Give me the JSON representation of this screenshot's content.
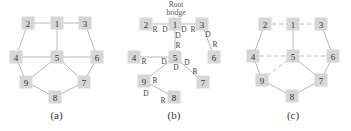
{
  "figure": {
    "panels": [
      {
        "id": "a",
        "caption": "(a)",
        "description": "Full bridged network topology",
        "nodes": [
          {
            "id": "1",
            "x": 57,
            "y": 23
          },
          {
            "id": "2",
            "x": 28,
            "y": 23
          },
          {
            "id": "3",
            "x": 85,
            "y": 23
          },
          {
            "id": "4",
            "x": 16,
            "y": 57
          },
          {
            "id": "5",
            "x": 57,
            "y": 57
          },
          {
            "id": "6",
            "x": 97,
            "y": 57
          },
          {
            "id": "9",
            "x": 26,
            "y": 82
          },
          {
            "id": "7",
            "x": 84,
            "y": 82
          },
          {
            "id": "8",
            "x": 55,
            "y": 97
          }
        ],
        "edges": [
          {
            "from": "2",
            "to": "1",
            "style": "solid"
          },
          {
            "from": "1",
            "to": "3",
            "style": "solid"
          },
          {
            "from": "2",
            "to": "4",
            "style": "solid"
          },
          {
            "from": "1",
            "to": "5",
            "style": "solid"
          },
          {
            "from": "3",
            "to": "6",
            "style": "solid"
          },
          {
            "from": "4",
            "to": "5",
            "style": "solid"
          },
          {
            "from": "5",
            "to": "6",
            "style": "solid"
          },
          {
            "from": "4",
            "to": "9",
            "style": "solid"
          },
          {
            "from": "5",
            "to": "9",
            "style": "solid"
          },
          {
            "from": "5",
            "to": "7",
            "style": "solid"
          },
          {
            "from": "6",
            "to": "7",
            "style": "solid"
          },
          {
            "from": "9",
            "to": "8",
            "style": "solid"
          },
          {
            "from": "8",
            "to": "7",
            "style": "solid"
          }
        ]
      },
      {
        "id": "b",
        "caption": "(b)",
        "description": "Spanning tree with root bridge and port roles",
        "root_label_line1": "Root",
        "root_label_line2": "bridge",
        "nodes": [
          {
            "id": "1",
            "x": 175,
            "y": 24
          },
          {
            "id": "2",
            "x": 146,
            "y": 24
          },
          {
            "id": "3",
            "x": 202,
            "y": 24
          },
          {
            "id": "4",
            "x": 134,
            "y": 57
          },
          {
            "id": "5",
            "x": 175,
            "y": 57
          },
          {
            "id": "6",
            "x": 214,
            "y": 57
          },
          {
            "id": "9",
            "x": 144,
            "y": 81
          },
          {
            "id": "7",
            "x": 203,
            "y": 82
          },
          {
            "id": "8",
            "x": 174,
            "y": 97
          }
        ],
        "edges": [
          {
            "from": "1",
            "to": "2",
            "style": "solid"
          },
          {
            "from": "1",
            "to": "3",
            "style": "solid"
          },
          {
            "from": "1",
            "to": "5",
            "style": "solid"
          },
          {
            "from": "3",
            "to": "6",
            "style": "solid"
          },
          {
            "from": "5",
            "to": "4",
            "style": "solid"
          },
          {
            "from": "5",
            "to": "9",
            "style": "solid"
          },
          {
            "from": "5",
            "to": "7",
            "style": "solid"
          },
          {
            "from": "9",
            "to": "8",
            "style": "solid"
          }
        ],
        "port_labels": [
          {
            "text": "R",
            "x": 155,
            "y": 29
          },
          {
            "text": "D",
            "x": 165,
            "y": 29
          },
          {
            "text": "D",
            "x": 184,
            "y": 29
          },
          {
            "text": "R",
            "x": 193,
            "y": 29
          },
          {
            "text": "D",
            "x": 178,
            "y": 35
          },
          {
            "text": "R",
            "x": 178,
            "y": 45
          },
          {
            "text": "D",
            "x": 208,
            "y": 34
          },
          {
            "text": "R",
            "x": 215,
            "y": 44
          },
          {
            "text": "R",
            "x": 144,
            "y": 61
          },
          {
            "text": "D",
            "x": 164,
            "y": 61
          },
          {
            "text": "D",
            "x": 187,
            "y": 62
          },
          {
            "text": "R",
            "x": 195,
            "y": 71
          },
          {
            "text": "D",
            "x": 176,
            "y": 67
          },
          {
            "text": "R",
            "x": 155,
            "y": 80
          },
          {
            "text": "D",
            "x": 146,
            "y": 93
          },
          {
            "text": "R",
            "x": 163,
            "y": 100
          }
        ]
      },
      {
        "id": "c",
        "caption": "(c)",
        "description": "Resulting active topology; dashed links blocked",
        "nodes": [
          {
            "id": "1",
            "x": 293,
            "y": 24
          },
          {
            "id": "2",
            "x": 265,
            "y": 24
          },
          {
            "id": "3",
            "x": 321,
            "y": 24
          },
          {
            "id": "4",
            "x": 253,
            "y": 56
          },
          {
            "id": "5",
            "x": 293,
            "y": 56
          },
          {
            "id": "6",
            "x": 333,
            "y": 56
          },
          {
            "id": "9",
            "x": 262,
            "y": 80
          },
          {
            "id": "7",
            "x": 321,
            "y": 80
          },
          {
            "id": "8",
            "x": 292,
            "y": 96
          }
        ],
        "edges": [
          {
            "from": "2",
            "to": "1",
            "style": "dashed"
          },
          {
            "from": "1",
            "to": "3",
            "style": "dashed"
          },
          {
            "from": "2",
            "to": "4",
            "style": "solid"
          },
          {
            "from": "1",
            "to": "5",
            "style": "solid"
          },
          {
            "from": "3",
            "to": "6",
            "style": "solid"
          },
          {
            "from": "4",
            "to": "5",
            "style": "dashed"
          },
          {
            "from": "5",
            "to": "6",
            "style": "dashed"
          },
          {
            "from": "4",
            "to": "9",
            "style": "solid"
          },
          {
            "from": "5",
            "to": "9",
            "style": "dashed"
          },
          {
            "from": "5",
            "to": "7",
            "style": "solid"
          },
          {
            "from": "6",
            "to": "7",
            "style": "solid"
          },
          {
            "from": "9",
            "to": "8",
            "style": "solid"
          },
          {
            "from": "8",
            "to": "7",
            "style": "solid"
          }
        ]
      }
    ],
    "captions_y": 119,
    "colors": {
      "node_fill": "#d6d6d6",
      "edge": "#b8b8b8",
      "text": "#333333"
    },
    "node_size": 13
  }
}
